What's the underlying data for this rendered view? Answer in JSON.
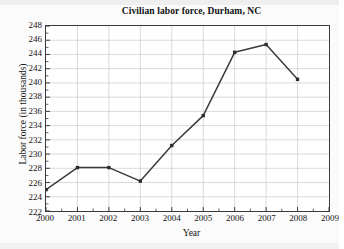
{
  "chart_data": {
    "type": "line",
    "title": "Civilian labor force, Durham, NC",
    "xlabel": "Year",
    "ylabel": "Labor force (in thousands)",
    "x": [
      2000,
      2001,
      2002,
      2003,
      2004,
      2005,
      2006,
      2007,
      2008
    ],
    "values": [
      225.0,
      228.1,
      228.1,
      226.2,
      231.2,
      235.4,
      244.3,
      245.4,
      240.5
    ],
    "series": [
      {
        "name": "Civilian labor force",
        "values": [
          225.0,
          228.1,
          228.1,
          226.2,
          231.2,
          235.4,
          244.3,
          245.4,
          240.5
        ]
      }
    ],
    "xlim": [
      2000,
      2009
    ],
    "ylim": [
      222,
      248
    ],
    "x_ticks": [
      "2000",
      "2001",
      "2002",
      "2003",
      "2004",
      "2005",
      "2006",
      "2007",
      "2008",
      "2009"
    ],
    "y_ticks": [
      "222",
      "224",
      "226",
      "228",
      "230",
      "232",
      "234",
      "236",
      "238",
      "240",
      "242",
      "244",
      "246",
      "248"
    ],
    "y_tick_step": 2,
    "x_tick_step": 1,
    "grid": true,
    "legend": null,
    "legend_position": "none",
    "colors": {
      "line": "#3b3b3b",
      "marker": "#2b2b2b",
      "grid": "#c9c9c9",
      "axis": "#3a3a3a",
      "plot_background": "#ffffff",
      "figure_background": "#fbfbfb",
      "text": "#141414"
    }
  }
}
